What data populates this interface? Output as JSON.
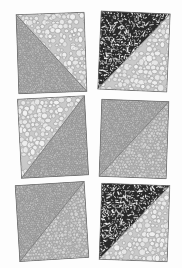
{
  "figure": {
    "kind": "micrograph-panel-grid",
    "title": "",
    "rows": 3,
    "cols": 2,
    "background_color": "#fdfdfd",
    "panel_shape": "square-slightly-rotated",
    "division": "single straight diagonal splitting each square into two triangular regions"
  },
  "texture_library": {
    "coarse_light": {
      "name": "coarse-light-granular",
      "base_color": "#c9c9c9",
      "grain_color": "#f2f2f2",
      "grain_edge": "#9a9a9a",
      "grain_size_px": 5.0,
      "density": 0.55,
      "description": "large pale rounded grains with light outlines, bright overall"
    },
    "medium_gray": {
      "name": "medium-gray-granular",
      "base_color": "#b2b2b2",
      "grain_color": "#d8d8d8",
      "grain_edge": "#8a8a8a",
      "grain_size_px": 3.2,
      "density": 0.7,
      "description": "medium rounded grains, mid gray"
    },
    "fine_dark": {
      "name": "fine-dark-granular",
      "base_color": "#a0a0a0",
      "grain_color": "#c4c4c4",
      "grain_edge": "#757575",
      "grain_size_px": 2.1,
      "density": 0.85,
      "description": "small tightly packed grains, darker mid gray"
    },
    "dark_speckled": {
      "name": "dark-speckled",
      "base_color": "#2a2a2a",
      "grain_color": "#f4f4f4",
      "grain_edge": "#0e0e0e",
      "grain_size_px": 2.6,
      "density": 0.45,
      "description": "near-black matrix with bright white irregular flecks"
    }
  },
  "panels": [
    {
      "id": "panel-r1c1",
      "position": {
        "row": 1,
        "col": 1
      },
      "rotation_deg": -2.0,
      "box": {
        "x": 17,
        "y": 13,
        "w": 69,
        "h": 80
      },
      "diagonal": "top-left to bottom-right",
      "regions": [
        {
          "side": "upper-right",
          "texture": "coarse_light"
        },
        {
          "side": "lower-left",
          "texture": "fine_dark"
        }
      ]
    },
    {
      "id": "panel-r1c2",
      "position": {
        "row": 1,
        "col": 2
      },
      "rotation_deg": 2.5,
      "box": {
        "x": 99,
        "y": 12,
        "w": 70,
        "h": 79
      },
      "diagonal": "top-right to bottom-left",
      "regions": [
        {
          "side": "upper-left",
          "texture": "dark_speckled"
        },
        {
          "side": "lower-right",
          "texture": "coarse_light"
        }
      ]
    },
    {
      "id": "panel-r2c1",
      "position": {
        "row": 2,
        "col": 1
      },
      "rotation_deg": -3.0,
      "box": {
        "x": 19,
        "y": 97,
        "w": 68,
        "h": 80
      },
      "diagonal": "top-right to bottom-left",
      "regions": [
        {
          "side": "upper-left",
          "texture": "coarse_light"
        },
        {
          "side": "lower-right",
          "texture": "fine_dark"
        }
      ]
    },
    {
      "id": "panel-r2c2",
      "position": {
        "row": 2,
        "col": 2
      },
      "rotation_deg": 2.0,
      "box": {
        "x": 100,
        "y": 100,
        "w": 68,
        "h": 78
      },
      "diagonal": "top-right to bottom-left",
      "regions": [
        {
          "side": "upper-left",
          "texture": "fine_dark"
        },
        {
          "side": "lower-right",
          "texture": "medium_gray"
        }
      ]
    },
    {
      "id": "panel-r3c1",
      "position": {
        "row": 3,
        "col": 1
      },
      "rotation_deg": -3.5,
      "box": {
        "x": 17,
        "y": 183,
        "w": 70,
        "h": 77
      },
      "diagonal": "top-right to bottom-left",
      "regions": [
        {
          "side": "upper-left",
          "texture": "fine_dark"
        },
        {
          "side": "lower-right",
          "texture": "medium_gray"
        }
      ]
    },
    {
      "id": "panel-r3c2",
      "position": {
        "row": 3,
        "col": 2
      },
      "rotation_deg": 2.0,
      "box": {
        "x": 100,
        "y": 184,
        "w": 69,
        "h": 77
      },
      "diagonal": "top-right to bottom-left",
      "regions": [
        {
          "side": "upper-left",
          "texture": "dark_speckled"
        },
        {
          "side": "lower-right",
          "texture": "coarse_light"
        }
      ]
    }
  ]
}
